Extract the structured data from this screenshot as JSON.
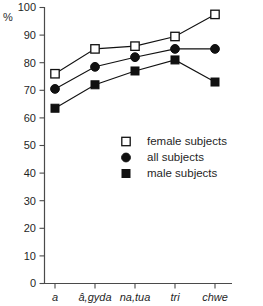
{
  "chart_data": {
    "type": "line",
    "title": "",
    "subtitle": "",
    "xlabel": "",
    "ylabel": "%",
    "ylim": [
      0,
      100
    ],
    "yticks": [
      0,
      10,
      20,
      30,
      40,
      50,
      60,
      70,
      80,
      90,
      100
    ],
    "grid": false,
    "legend_position": "center-right-inside",
    "categories": [
      "a",
      "â,gyda",
      "na,tua",
      "tri",
      "chwe"
    ],
    "series": [
      {
        "name": "female subjects",
        "marker": "open-square",
        "color": "#111111",
        "values": [
          76,
          85,
          86,
          89.5,
          97.5
        ]
      },
      {
        "name": "all  subjects",
        "marker": "filled-circle",
        "color": "#111111",
        "values": [
          70.5,
          78.5,
          82,
          85,
          85
        ]
      },
      {
        "name": "male subjects",
        "marker": "filled-square",
        "color": "#111111",
        "values": [
          63.5,
          72,
          77,
          81,
          73
        ]
      }
    ]
  },
  "axes": {
    "y_unit_label": "%",
    "y_tick_labels": [
      "100",
      "90",
      "80",
      "70",
      "60",
      "50",
      "40",
      "30",
      "20",
      "10",
      "0"
    ],
    "x_tick_labels": [
      "a",
      "â,gyda",
      "na,tua",
      "tri",
      "chwe"
    ]
  },
  "legend": {
    "entries": [
      {
        "label": "female subjects",
        "marker_name": "open-square-marker"
      },
      {
        "label": "all  subjects",
        "marker_name": "filled-circle-marker"
      },
      {
        "label": "male subjects",
        "marker_name": "filled-square-marker"
      }
    ]
  },
  "colors": {
    "ink": "#111111",
    "axis": "#4a4a4a",
    "background": "#ffffff"
  }
}
